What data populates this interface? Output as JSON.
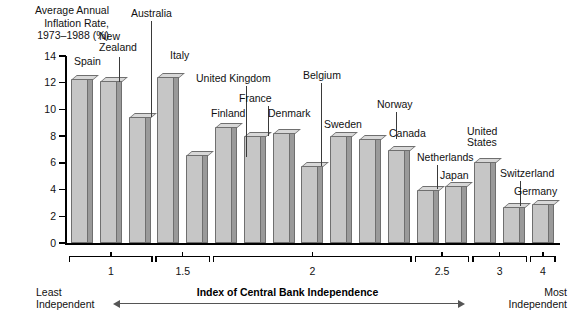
{
  "chart_data": {
    "type": "bar",
    "title_lines": [
      "Average Annual",
      "Inflation Rate,",
      "1973–1988 (%)"
    ],
    "ylabel": "Average Annual Inflation Rate, 1973-1988 (%)",
    "xlabel": "Index of Central Bank Independence",
    "ylim": [
      0,
      14
    ],
    "yticks": [
      0,
      2,
      4,
      6,
      8,
      10,
      12,
      14
    ],
    "grid": false,
    "legend": null,
    "categories": [
      "Spain",
      "New Zealand",
      "Australia",
      "Italy",
      "United Kingdom",
      "Finland",
      "France",
      "Denmark",
      "Belgium",
      "Sweden",
      "Norway",
      "Canada",
      "Netherlands",
      "Japan",
      "United States",
      "Switzerland",
      "Germany"
    ],
    "values": [
      12.3,
      12.1,
      9.4,
      12.4,
      6.6,
      8.7,
      8.0,
      8.2,
      5.8,
      8.0,
      7.8,
      7.0,
      4.0,
      4.3,
      6.1,
      2.7,
      2.9
    ],
    "x_group_labels": [
      "1",
      "1.5",
      "2",
      "2.5",
      "3",
      "4"
    ],
    "x_group_spans": [
      [
        0,
        3
      ],
      [
        3,
        5
      ],
      [
        5,
        12
      ],
      [
        12,
        14
      ],
      [
        14,
        16
      ],
      [
        16,
        17
      ]
    ],
    "annotations": {
      "left_low": "Least",
      "left_low2": "Independent",
      "right_high": "Most",
      "right_high2": "Independent"
    }
  },
  "axis": {
    "y_tick_labels": [
      "14",
      "12",
      "10",
      "8",
      "6",
      "4",
      "2",
      "0"
    ]
  },
  "footer": {
    "caption": "Index of Central Bank Independence",
    "least_line1": "Least",
    "least_line2": "Independent",
    "most_line1": "Most",
    "most_line2": "Independent"
  }
}
